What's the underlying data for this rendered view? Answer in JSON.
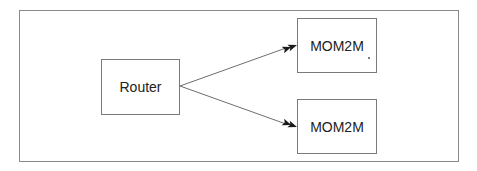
{
  "diagram": {
    "type": "flow",
    "frame": {
      "border_color": "#8a8a8a"
    },
    "nodes": [
      {
        "id": "router",
        "label": "Router"
      },
      {
        "id": "mom2m_top",
        "label": "MOM2M"
      },
      {
        "id": "mom2m_bottom",
        "label": "MOM2M"
      }
    ],
    "edges": [
      {
        "from": "router",
        "to": "mom2m_top",
        "arrowhead": "double-filled"
      },
      {
        "from": "router",
        "to": "mom2m_bottom",
        "arrowhead": "double-filled"
      }
    ],
    "colors": {
      "line": "#6e6e6e",
      "arrowhead": "#1a1a1a",
      "text": "#222222",
      "box_border": "#7a7a7a"
    }
  }
}
